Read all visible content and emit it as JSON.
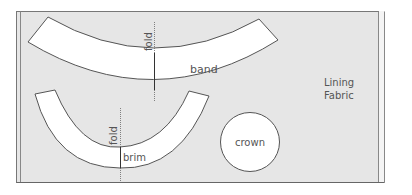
{
  "diagram": {
    "type": "sewing-pattern-layout",
    "fabric": {
      "label_line1": "Lining",
      "label_line2": "Fabric",
      "fill": "#e6e6e6",
      "border": "#777777"
    },
    "pieces": {
      "band": {
        "label": "band",
        "fold_label": "fold"
      },
      "brim": {
        "label": "brim",
        "fold_label": "fold"
      },
      "crown": {
        "label": "crown"
      }
    },
    "colors": {
      "piece_fill": "#ffffff",
      "outline": "#555555",
      "fold_line": "#444444",
      "text": "#555555"
    }
  }
}
